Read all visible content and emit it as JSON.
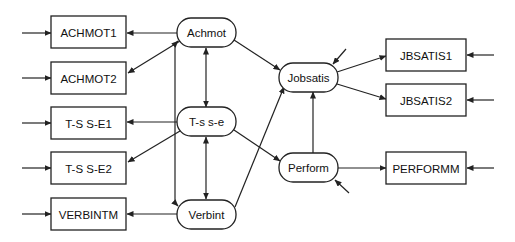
{
  "diagram": {
    "type": "structural-equation-path-diagram",
    "observed": [
      {
        "id": "achmot1",
        "label": "ACHMOT1"
      },
      {
        "id": "achmot2",
        "label": "ACHMOT2"
      },
      {
        "id": "tsse1",
        "label": "T-S S-E1"
      },
      {
        "id": "tsse2",
        "label": "T-S S-E2"
      },
      {
        "id": "verbintm",
        "label": "VERBINTM"
      },
      {
        "id": "jbsatis1",
        "label": "JBSATIS1"
      },
      {
        "id": "jbsatis2",
        "label": "JBSATIS2"
      },
      {
        "id": "performm",
        "label": "PERFORMM"
      }
    ],
    "latent": [
      {
        "id": "achmot",
        "label": "Achmot"
      },
      {
        "id": "tsse",
        "label": "T-s s-e"
      },
      {
        "id": "verbint",
        "label": "Verbint"
      },
      {
        "id": "jobsatis",
        "label": "Jobsatis"
      },
      {
        "id": "perform",
        "label": "Perform"
      }
    ],
    "paths": [
      {
        "from": "Achmot",
        "to": "ACHMOT1"
      },
      {
        "from": "Achmot",
        "to": "ACHMOT2"
      },
      {
        "from": "T-s s-e",
        "to": "T-S S-E1"
      },
      {
        "from": "T-s s-e",
        "to": "T-S S-E2"
      },
      {
        "from": "Verbint",
        "to": "VERBINTM"
      },
      {
        "from": "Jobsatis",
        "to": "JBSATIS1"
      },
      {
        "from": "Jobsatis",
        "to": "JBSATIS2"
      },
      {
        "from": "Perform",
        "to": "PERFORMM"
      },
      {
        "from": "Achmot",
        "to": "Jobsatis"
      },
      {
        "from": "T-s s-e",
        "to": "Perform"
      },
      {
        "from": "Verbint",
        "to": "Jobsatis"
      },
      {
        "from": "Perform",
        "to": "Jobsatis"
      }
    ],
    "correlations": [
      {
        "a": "Achmot",
        "b": "T-s s-e"
      },
      {
        "a": "T-s s-e",
        "b": "Verbint"
      },
      {
        "a": "Achmot",
        "b": "Verbint"
      }
    ],
    "error_terms": [
      "ACHMOT1",
      "ACHMOT2",
      "T-S S-E1",
      "T-S S-E2",
      "VERBINTM",
      "JBSATIS1",
      "JBSATIS2",
      "PERFORMM",
      "Jobsatis",
      "Perform"
    ]
  }
}
